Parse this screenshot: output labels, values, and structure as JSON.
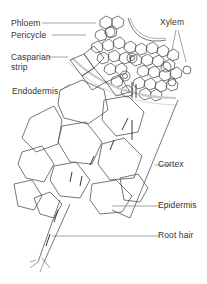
{
  "diagram": {
    "labels": {
      "phloem": "Phloem",
      "pericycle": "Pericycle",
      "casparian_strip_line1": "Casparian",
      "casparian_strip_line2": "strip",
      "endodermis": "Endodermis",
      "xylem": "Xylem",
      "cortex": "Cortex",
      "epidermis": "Epidermis",
      "root_hair": "Root hair"
    },
    "colors": {
      "line": "#444444",
      "casparian_band": "#c8c8c8",
      "text": "#333333"
    }
  }
}
